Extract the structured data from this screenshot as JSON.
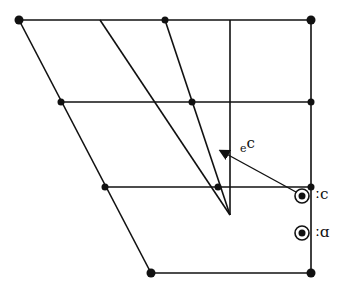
{
  "diagram": {
    "type": "IPA vowel quadrilateral",
    "colors": {
      "stroke": "#111111",
      "background": "#ffffff"
    },
    "labels": {
      "diphthong_base": "ɔ",
      "diphthong_offglide": "ə",
      "vowel_1": "ɔː",
      "vowel_2": "ɒː"
    },
    "grid_points": [
      {
        "x": 19,
        "y": 20
      },
      {
        "x": 165,
        "y": 20
      },
      {
        "x": 311,
        "y": 20
      },
      {
        "x": 61,
        "y": 102
      },
      {
        "x": 192,
        "y": 102
      },
      {
        "x": 311,
        "y": 102
      },
      {
        "x": 105,
        "y": 187
      },
      {
        "x": 218,
        "y": 187
      },
      {
        "x": 311,
        "y": 187
      },
      {
        "x": 151,
        "y": 273
      },
      {
        "x": 311,
        "y": 273
      }
    ],
    "vowel_markers": [
      {
        "name": "ɔː",
        "x": 302,
        "y": 196
      },
      {
        "name": "ɒː",
        "x": 302,
        "y": 233
      }
    ],
    "arrow": {
      "from": {
        "x": 296,
        "y": 192
      },
      "to": {
        "x": 220,
        "y": 150
      },
      "label": "ɔə"
    }
  }
}
